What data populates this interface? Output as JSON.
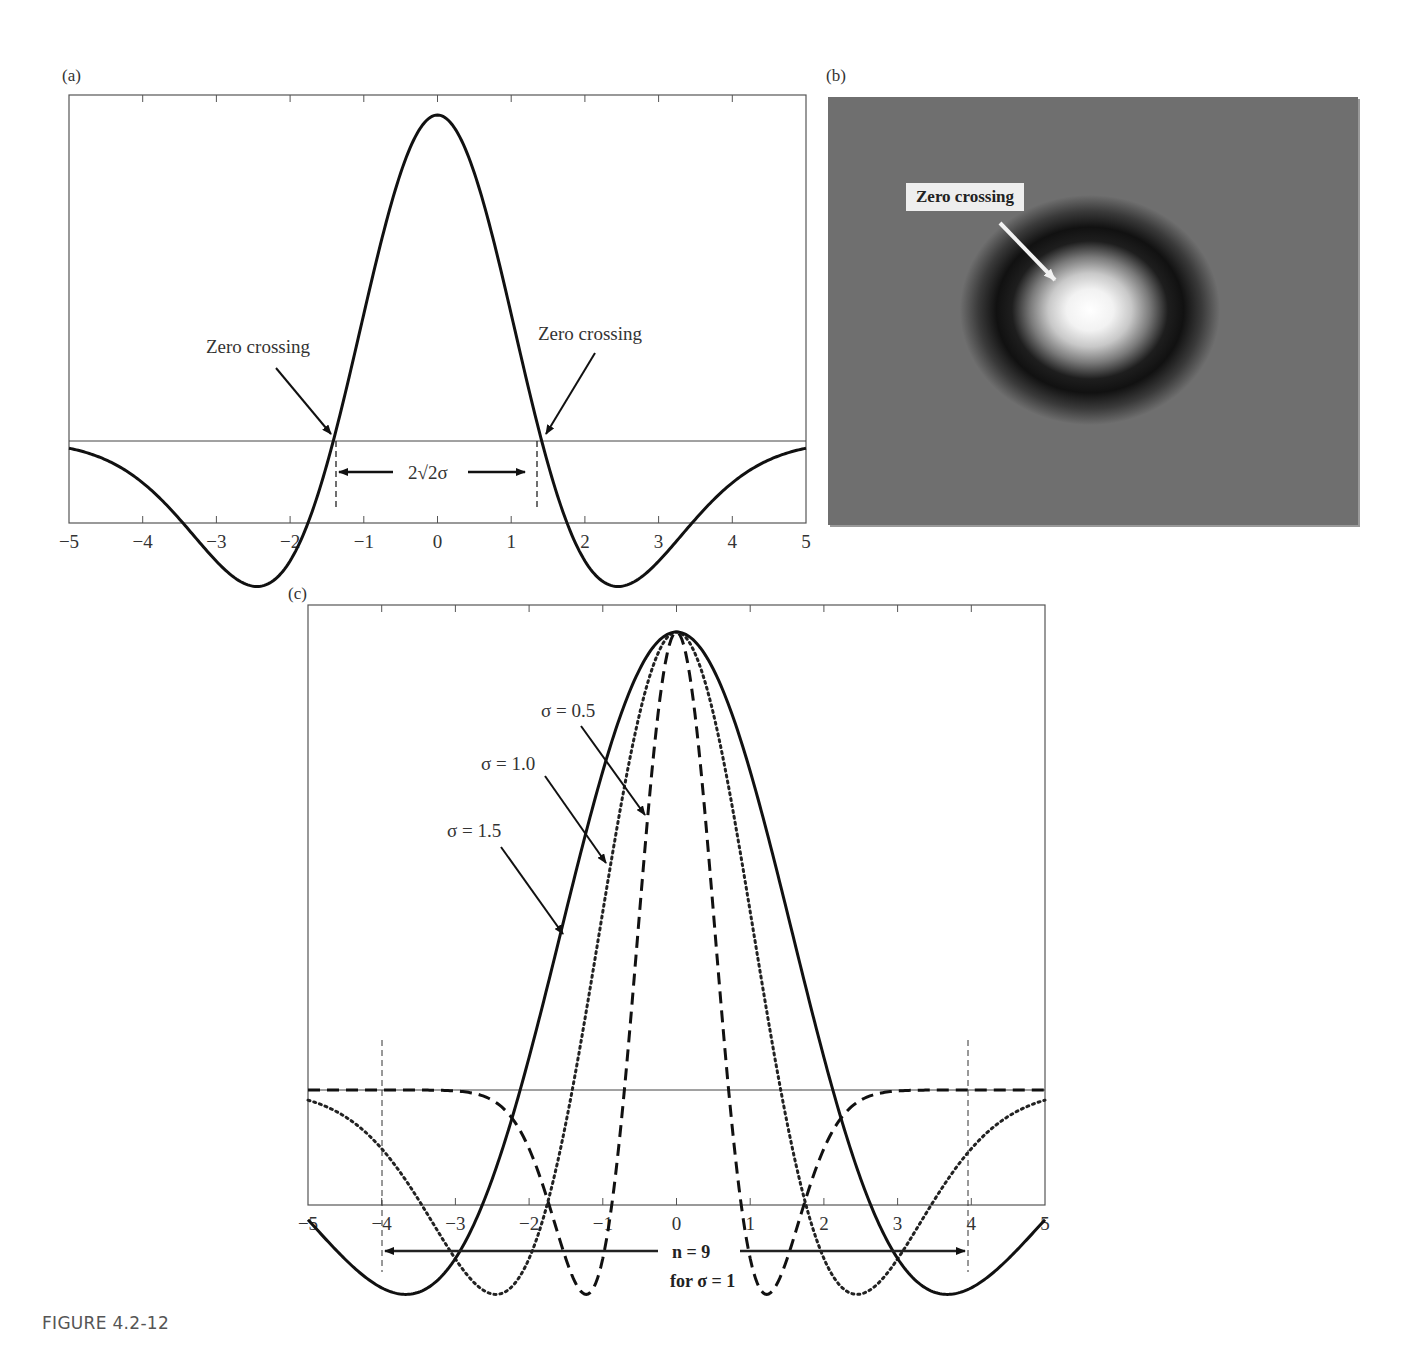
{
  "figure": {
    "caption": "FIGURE 4.2-12"
  },
  "panels": {
    "a": {
      "label": "(a)"
    },
    "b": {
      "label": "(b)",
      "annotation": "Zero crossing"
    },
    "c": {
      "label": "(c)"
    }
  },
  "chart_data": [
    {
      "id": "a",
      "type": "line",
      "title": "",
      "xlabel": "",
      "ylabel": "",
      "xlim": [
        -5,
        5
      ],
      "x_ticks": [
        -5,
        -4,
        -3,
        -2,
        -1,
        0,
        1,
        2,
        3,
        4,
        5
      ],
      "x_tick_labels": [
        "−5",
        "−4",
        "−3",
        "−2",
        "−1",
        "0",
        "1",
        "2",
        "3",
        "4",
        "5"
      ],
      "grid": false,
      "series": [
        {
          "name": "LoG profile (σ = 1)",
          "style": "solid",
          "function": "(1 - x^2/2) * exp(-x^2/4)",
          "x": [
            -5,
            -4,
            -3,
            -2.5,
            -2,
            -1.5,
            -1.414,
            -1,
            -0.5,
            0,
            0.5,
            1,
            1.414,
            1.5,
            2,
            2.5,
            3,
            4,
            5
          ],
          "y": [
            -0.022,
            -0.128,
            -0.37,
            -0.443,
            -0.368,
            -0.079,
            0,
            0.389,
            0.827,
            1,
            0.827,
            0.389,
            0,
            -0.079,
            -0.368,
            -0.443,
            -0.37,
            -0.128,
            -0.022
          ]
        }
      ],
      "annotations": [
        {
          "text": "Zero crossing",
          "x": -1.414
        },
        {
          "text": "Zero crossing",
          "x": 1.414
        },
        {
          "text": "2√2σ",
          "type": "width-arrow",
          "from": -1.414,
          "to": 1.414
        }
      ]
    },
    {
      "id": "b",
      "type": "heatmap",
      "title": "",
      "description": "2-D LoG (Mexican hat) filter image: bright center, dark ring, gray background",
      "annotations": [
        {
          "text": "Zero crossing"
        }
      ]
    },
    {
      "id": "c",
      "type": "line",
      "title": "",
      "xlabel": "",
      "ylabel": "",
      "xlim": [
        -5,
        5
      ],
      "x_ticks": [
        -5,
        -4,
        -3,
        -2,
        -1,
        0,
        1,
        2,
        3,
        4,
        5
      ],
      "x_tick_labels": [
        "−5",
        "−4",
        "−3",
        "−2",
        "−1",
        "0",
        "1",
        "2",
        "3",
        "4",
        "5"
      ],
      "grid": false,
      "series": [
        {
          "name": "σ = 0.5",
          "style": "dashed",
          "sigma": 0.5,
          "min_x": [
            -1,
            1
          ],
          "zero_crossings": [
            -0.707,
            0.707
          ]
        },
        {
          "name": "σ = 1.0",
          "style": "dotted",
          "sigma": 1.0,
          "min_x": [
            -2,
            2
          ],
          "zero_crossings": [
            -1.414,
            1.414
          ]
        },
        {
          "name": "σ = 1.5",
          "style": "solid",
          "sigma": 1.5,
          "min_x": [
            -3,
            3
          ],
          "zero_crossings": [
            -2.121,
            2.121
          ]
        }
      ],
      "annotations": [
        {
          "text": "σ = 0.5"
        },
        {
          "text": "σ = 1.0"
        },
        {
          "text": "σ = 1.5"
        },
        {
          "text": "n = 9",
          "type": "width-arrow",
          "from": -4,
          "to": 4
        },
        {
          "text": "for σ = 1"
        }
      ]
    }
  ]
}
